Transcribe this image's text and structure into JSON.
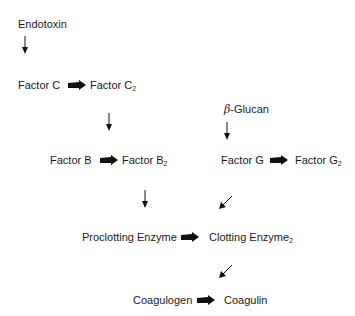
{
  "diagram": {
    "nodes": {
      "endotoxin": "Endotoxin",
      "factor_c": "Factor C",
      "factor_c2": "Factor C",
      "factor_c2_sub": "2",
      "beta_glucan_symbol": "β",
      "beta_glucan": "-Glucan",
      "factor_b": "Factor B",
      "factor_b2": "Factor B",
      "factor_b2_sub": "2",
      "factor_g": "Factor G",
      "factor_g2": "Factor G",
      "factor_g2_sub": "2",
      "proclotting_enzyme": "Proclotting Enzyme",
      "clotting_enzyme2": "Clotting Enzyme",
      "clotting_enzyme2_sub": "2",
      "coagulogen": "Coagulogen",
      "coagulin": "Coagulin"
    },
    "edges": [
      {
        "from": "Endotoxin",
        "to": "Factor C",
        "type": "thin-arrow"
      },
      {
        "from": "Factor C",
        "to": "Factor C2",
        "type": "block-arrow"
      },
      {
        "from": "Factor C2",
        "to": "Factor B",
        "type": "thin-arrow"
      },
      {
        "from": "Factor B",
        "to": "Factor B2",
        "type": "block-arrow"
      },
      {
        "from": "β-Glucan",
        "to": "Factor G",
        "type": "thin-arrow"
      },
      {
        "from": "Factor G",
        "to": "Factor G2",
        "type": "block-arrow"
      },
      {
        "from": "Factor B2",
        "to": "Proclotting Enzyme",
        "type": "thin-arrow"
      },
      {
        "from": "Factor G2",
        "to": "Clotting Enzyme2",
        "type": "thin-arrow-diagonal"
      },
      {
        "from": "Proclotting Enzyme",
        "to": "Clotting Enzyme2",
        "type": "block-arrow"
      },
      {
        "from": "Clotting Enzyme2",
        "to": "Coagulogen",
        "type": "thin-arrow-diagonal"
      },
      {
        "from": "Coagulogen",
        "to": "Coagulin",
        "type": "block-arrow"
      }
    ],
    "colors": {
      "text": "#1a1a1a",
      "arrow": "#111111",
      "background": "#ffffff"
    }
  }
}
